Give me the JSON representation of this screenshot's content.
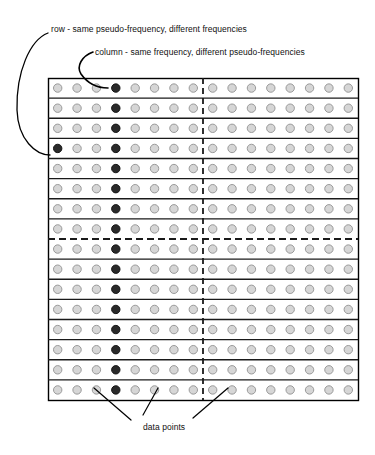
{
  "figure": {
    "annotations": {
      "row_label": "row - same pseudo-frequency, different frequencies",
      "column_label": "column - same frequency, different pseudo-frequencies",
      "data_points_label": "data points"
    },
    "colors": {
      "dot_fill": "#d6d6d6",
      "dot_stroke": "#9a9a9a",
      "dot_highlight_fill": "#2a2a2a",
      "dot_highlight_stroke": "#141414",
      "grid_line": "#1a1a1a",
      "frame": "#000000",
      "text": "#111111",
      "background": "#ffffff"
    },
    "grid": {
      "rows": 16,
      "columns": 16,
      "x": 48,
      "y": 78,
      "width": 310,
      "height": 322,
      "divider_row_index": 8,
      "divider_column_index": 8,
      "dot_radius": 4.2,
      "highlight_column_index": 3,
      "row_highlight": {
        "row": 3,
        "column": 0
      }
    },
    "leaders": {
      "row_path": "M 48 33 C 30 40 16 72 17 110 C 18 140 36 155 50 155",
      "column_path": "M 93 52 C 82 56 76 66 81 74 C 88 84 98 88 108 88",
      "data_point_paths": [
        "M 94 388 L 131 420",
        "M 158 388 L 143 415",
        "M 228 388 L 193 418"
      ]
    }
  }
}
